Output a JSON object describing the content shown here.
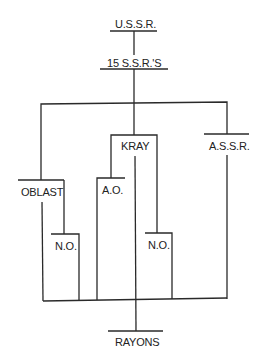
{
  "diagram": {
    "type": "hierarchy",
    "nodes": {
      "ussr": "U.S.S.R.",
      "ssrs": "15 S.S.R.'S",
      "oblast": "OBLAST",
      "kray": "KRAY",
      "assr": "A.S.S.R.",
      "ao": "A.O.",
      "no_left": "N.O.",
      "no_right": "N.O.",
      "rayons": "RAYONS"
    },
    "edges": [
      [
        "U.S.S.R.",
        "15 S.S.R.'S"
      ],
      [
        "15 S.S.R.'S",
        "OBLAST"
      ],
      [
        "15 S.S.R.'S",
        "KRAY"
      ],
      [
        "15 S.S.R.'S",
        "A.S.S.R."
      ],
      [
        "OBLAST",
        "N.O."
      ],
      [
        "KRAY",
        "A.O."
      ],
      [
        "KRAY",
        "N.O."
      ],
      [
        "OBLAST",
        "RAYONS"
      ],
      [
        "N.O.",
        "RAYONS"
      ],
      [
        "A.O.",
        "RAYONS"
      ],
      [
        "KRAY",
        "RAYONS"
      ],
      [
        "A.S.S.R.",
        "RAYONS"
      ]
    ]
  }
}
